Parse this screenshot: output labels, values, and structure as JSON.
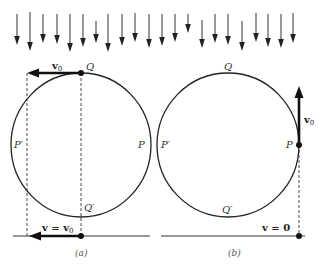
{
  "diagram": {
    "rain_arrows": {
      "x": [
        17,
        30,
        43,
        57,
        70,
        83,
        96,
        108,
        122,
        135,
        149,
        162,
        175,
        188,
        202,
        215,
        228,
        242,
        256,
        268,
        281,
        293
      ],
      "y_top": [
        14,
        12,
        14,
        14,
        14,
        14,
        21,
        14,
        14,
        13,
        14,
        14,
        14,
        14,
        20,
        14,
        14,
        21,
        13,
        14,
        14,
        13
      ],
      "y_bottom": [
        45,
        51,
        43,
        44,
        52,
        47,
        43,
        52,
        46,
        42,
        48,
        46,
        42,
        33,
        48,
        43,
        45,
        51,
        42,
        47,
        48,
        43
      ],
      "color": "#555555"
    },
    "panel_a": {
      "caption": "(a)",
      "labels": {
        "Q": "Q",
        "P": "P",
        "P_prime": "P′",
        "Q_prime": "Q′",
        "top_velocity": "v",
        "top_velocity_sub": "0",
        "bottom_velocity": "v = v",
        "bottom_velocity_sub": "0"
      }
    },
    "panel_b": {
      "caption": "(b)",
      "labels": {
        "Q": "Q",
        "P": "P",
        "P_prime": "P′",
        "Q_prime": "Q′",
        "side_velocity": "v",
        "side_velocity_sub": "0",
        "bottom_velocity": "v = 0"
      }
    }
  }
}
